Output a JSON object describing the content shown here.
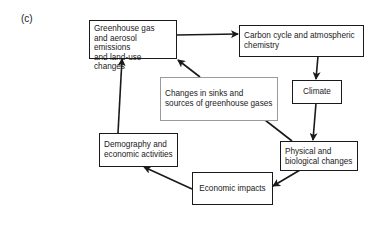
{
  "panel_label": "(c)",
  "nodes": {
    "emissions": {
      "lines": [
        "Greenhouse gas",
        "and aerosol emissions",
        "and land-use changes"
      ]
    },
    "carbon": {
      "lines": [
        "Carbon cycle and atmospheric",
        "chemistry"
      ]
    },
    "climate": {
      "lines": [
        "Climate"
      ]
    },
    "sinks": {
      "lines": [
        "Changes in sinks and",
        "sources of greenhouse gases"
      ]
    },
    "physical": {
      "lines": [
        "Physical and",
        "biological changes"
      ]
    },
    "economic": {
      "lines": [
        "Economic impacts"
      ]
    },
    "demography": {
      "lines": [
        "Demography and",
        "economic activities"
      ]
    }
  },
  "edges": [
    {
      "from": "emissions",
      "to": "carbon"
    },
    {
      "from": "carbon",
      "to": "climate"
    },
    {
      "from": "climate",
      "to": "physical"
    },
    {
      "from": "physical",
      "to": "sinks",
      "arrow": false
    },
    {
      "from": "sinks",
      "to": "emissions"
    },
    {
      "from": "physical",
      "to": "economic"
    },
    {
      "from": "economic",
      "to": "demography"
    },
    {
      "from": "demography",
      "to": "emissions"
    }
  ],
  "colors": {
    "stroke": "#1a1a1a",
    "gray_border": "#9a9a9a"
  }
}
